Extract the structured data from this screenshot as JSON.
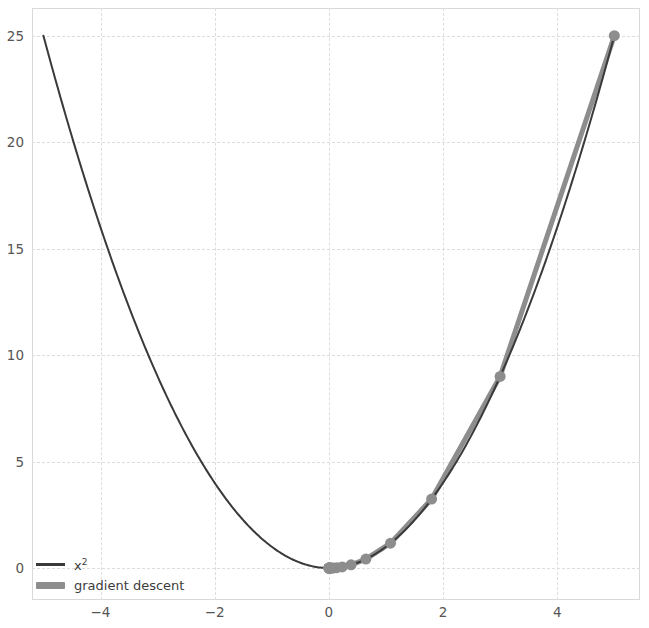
{
  "figure": {
    "width": 649,
    "height": 628,
    "background": "#ffffff"
  },
  "legend": {
    "position": "lower-left",
    "items": [
      {
        "key": "curve",
        "label": "x²",
        "color": "#3a3a3a",
        "style": "line"
      },
      {
        "key": "path",
        "label": "gradient descent",
        "color": "#8d8d8d",
        "style": "line-with-markers"
      }
    ]
  },
  "axes": {
    "xlim": [
      -5.2,
      5.45
    ],
    "ylim": [
      -1.5,
      26.3
    ],
    "xticks": [
      "−4",
      "−2",
      "0",
      "2",
      "4"
    ],
    "xtick_values": [
      -4,
      -2,
      0,
      2,
      4
    ],
    "yticks": [
      "0",
      "5",
      "10",
      "15",
      "20",
      "25"
    ],
    "ytick_values": [
      0,
      5,
      10,
      15,
      20,
      25
    ],
    "grid": true,
    "grid_color": "#dddddd",
    "frame_color": "#d8d8d8"
  },
  "chart_data": {
    "type": "line",
    "title": "",
    "xlabel": "",
    "ylabel": "",
    "xlim": [
      -5.2,
      5.45
    ],
    "ylim": [
      -1.5,
      26.3
    ],
    "grid": true,
    "legend_position": "lower-left",
    "series": [
      {
        "name": "x²",
        "type": "line",
        "color": "#3a3a3a",
        "linewidth": 2,
        "markers": false,
        "function": "y = x^2",
        "x": [
          -5,
          -4.75,
          -4.5,
          -4.25,
          -4,
          -3.75,
          -3.5,
          -3.25,
          -3,
          -2.75,
          -2.5,
          -2.25,
          -2,
          -1.75,
          -1.5,
          -1.25,
          -1,
          -0.75,
          -0.5,
          -0.25,
          0,
          0.25,
          0.5,
          0.75,
          1,
          1.25,
          1.5,
          1.75,
          2,
          2.25,
          2.5,
          2.75,
          3,
          3.25,
          3.5,
          3.75,
          4,
          4.25,
          4.5,
          4.75,
          5
        ],
        "y": [
          25,
          22.5625,
          20.25,
          18.0625,
          16,
          14.0625,
          12.25,
          10.5625,
          9,
          7.5625,
          6.25,
          5.0625,
          4,
          3.0625,
          2.25,
          1.5625,
          1,
          0.5625,
          0.25,
          0.0625,
          0,
          0.0625,
          0.25,
          0.5625,
          1,
          1.5625,
          2.25,
          3.0625,
          4,
          5.0625,
          6.25,
          7.5625,
          9,
          10.5625,
          12.25,
          14.0625,
          16,
          18.0625,
          20.25,
          22.5625,
          25
        ]
      },
      {
        "name": "gradient descent",
        "type": "line",
        "color": "#8d8d8d",
        "linewidth": 5,
        "markers": true,
        "marker": "o",
        "markersize": 11,
        "learning_rate": 0.2,
        "start_x": 5,
        "x": [
          5,
          3,
          1.8,
          1.08,
          0.648,
          0.3888,
          0.23328,
          0.139968,
          0.0839808,
          0.05038848,
          0.030233088,
          0.0181398528,
          0.01088391168,
          0.006530347008,
          0.0039182082,
          0.0023509249,
          0.0014105549,
          0.000846333,
          0.0005078
        ],
        "y": [
          25,
          9,
          3.24,
          1.1664,
          0.419904,
          0.15116544,
          0.054419558,
          0.019591041,
          0.007052775,
          0.002538999,
          0.000914039,
          0.000329054,
          0.000118459,
          4.2645e-05,
          1.5352e-05,
          5.527e-06,
          1.99e-06,
          7.16e-07,
          2.58e-07
        ]
      }
    ]
  }
}
